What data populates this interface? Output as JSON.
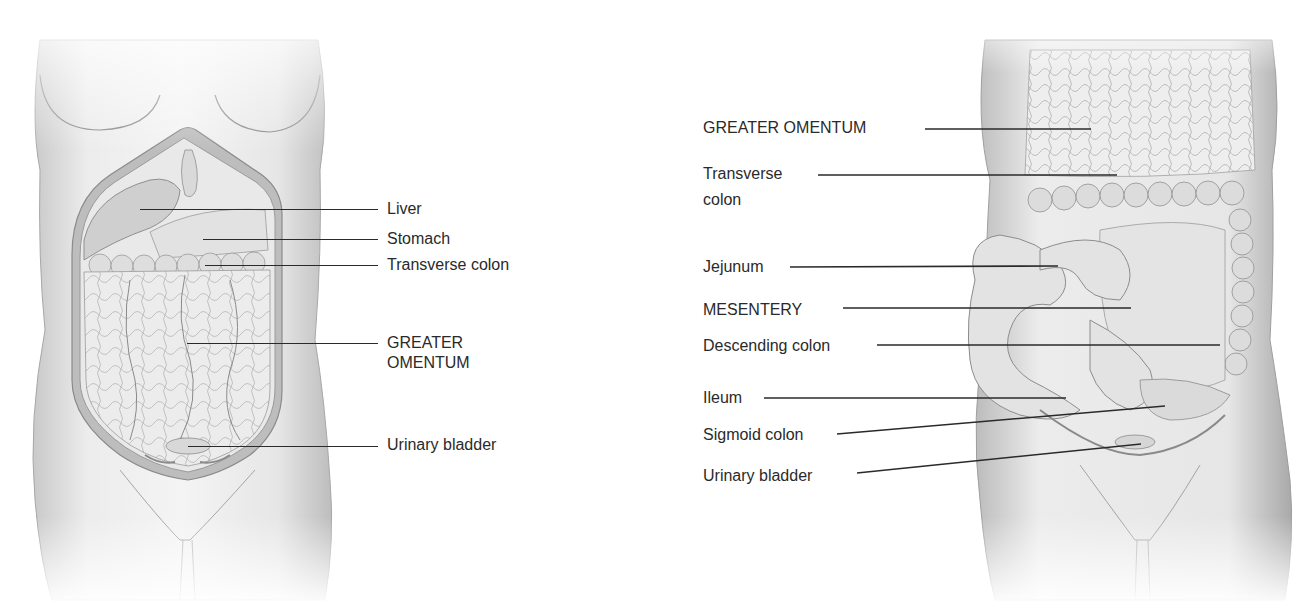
{
  "figure": {
    "panels": [
      {
        "id": "a",
        "view": "anterior abdomen with greater omentum in place",
        "labels": [
          {
            "text": "Liver",
            "x": 387,
            "y": 199,
            "line": {
              "x1": 140,
              "y1": 209,
              "x2": 378,
              "y2": 209
            }
          },
          {
            "text": "Stomach",
            "x": 387,
            "y": 229,
            "line": {
              "x1": 203,
              "y1": 239,
              "x2": 378,
              "y2": 239
            }
          },
          {
            "text": "Transverse colon",
            "x": 387,
            "y": 255,
            "line": {
              "x1": 205,
              "y1": 265,
              "x2": 378,
              "y2": 265
            }
          },
          {
            "text": "GREATER",
            "x": 387,
            "y": 333,
            "line": {
              "x1": 187,
              "y1": 343,
              "x2": 378,
              "y2": 343
            }
          },
          {
            "text": "OMENTUM",
            "x": 387,
            "y": 353,
            "line": null
          },
          {
            "text": "Urinary bladder",
            "x": 387,
            "y": 435,
            "line": {
              "x1": 188,
              "y1": 446,
              "x2": 378,
              "y2": 446
            }
          }
        ]
      },
      {
        "id": "b",
        "view": "anterior abdomen with greater omentum reflected",
        "labels": [
          {
            "text": "GREATER OMENTUM",
            "x": 703,
            "y": 118,
            "line": {
              "x1": 925,
              "y1": 129,
              "x2": 1091,
              "y2": 129
            }
          },
          {
            "text": "Transverse",
            "x": 703,
            "y": 164,
            "line": {
              "x1": 818,
              "y1": 175,
              "x2": 1117,
              "y2": 175
            }
          },
          {
            "text": "colon",
            "x": 703,
            "y": 190,
            "line": null
          },
          {
            "text": "Jejunum",
            "x": 703,
            "y": 257,
            "line": {
              "x1": 790,
              "y1": 267,
              "x2": 1058,
              "y2": 266
            }
          },
          {
            "text": "MESENTERY",
            "x": 703,
            "y": 300,
            "line": {
              "x1": 843,
              "y1": 308,
              "x2": 1131,
              "y2": 308
            }
          },
          {
            "text": "Descending colon",
            "x": 703,
            "y": 336,
            "line": {
              "x1": 877,
              "y1": 345,
              "x2": 1220,
              "y2": 345
            }
          },
          {
            "text": "Ileum",
            "x": 703,
            "y": 388,
            "line": {
              "x1": 764,
              "y1": 398,
              "x2": 1066,
              "y2": 398
            }
          },
          {
            "text": "Sigmoid colon",
            "x": 703,
            "y": 425,
            "line": {
              "x1": 837,
              "y1": 434,
              "x2": 1165,
              "y2": 406
            }
          },
          {
            "text": "Urinary bladder",
            "x": 703,
            "y": 466,
            "line": {
              "x1": 857,
              "y1": 473,
              "x2": 1141,
              "y2": 444
            }
          }
        ]
      }
    ]
  },
  "colors": {
    "ink": "#2a2a2a",
    "skin_light": "#f2f2f2",
    "skin_mid": "#d6d6d6",
    "skin_dark": "#9a9a9a",
    "organ": "#e6e6e6",
    "vessel": "#7a7a7a"
  }
}
